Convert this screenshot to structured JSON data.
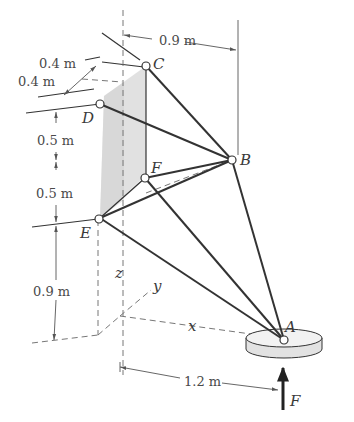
{
  "figure": {
    "type": "3D space truss / tripod statics diagram",
    "points": {
      "A": "A",
      "B": "B",
      "C": "C",
      "D": "D",
      "E": "E",
      "F": "F"
    },
    "axes": {
      "x": "x",
      "y": "y",
      "z": "z"
    },
    "force": {
      "label": "F",
      "direction": "upward at A"
    },
    "dimensions": {
      "horizontal_top": "0.9 m",
      "depth_upper": "0.4 m",
      "depth_lower": "0.4 m",
      "vertical_DF": "0.5 m",
      "vertical_FE": "0.5 m",
      "vertical_E_ground": "0.9 m",
      "horizontal_bottom": "1.2 m"
    },
    "members": [
      "C-B",
      "D-B",
      "F-B",
      "E-B",
      "B-A",
      "E-A",
      "F-A",
      "E-F",
      "C-F (vertical)"
    ],
    "colors": {
      "member": "#3a3a3a",
      "shade": "#d9d9d9",
      "dashed": "#777777",
      "disk": "#e6e6e6"
    }
  }
}
